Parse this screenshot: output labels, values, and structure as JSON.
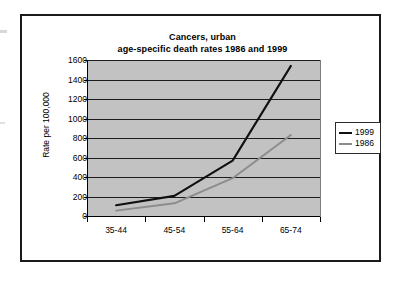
{
  "chart_data": {
    "type": "line",
    "title": "Cancers, urban",
    "subtitle": "age-specific death rates 1986 and 1999",
    "title_line1": "Cancers, urban",
    "title_line2": "age-specific death rates 1986 and 1999",
    "xlabel": "",
    "ylabel": "Rate per 100,000",
    "categories": [
      "35-44",
      "45-54",
      "55-64",
      "65-74"
    ],
    "ylim": [
      0,
      1600
    ],
    "ytick_step": 200,
    "yticks": [
      0,
      200,
      400,
      600,
      800,
      1000,
      1200,
      1400,
      1600
    ],
    "ytick_labels": [
      "0",
      "200",
      "400",
      "600",
      "800",
      "1000",
      "1200",
      "1400",
      "1600"
    ],
    "grid": true,
    "legend_position": "right",
    "plot_background": "#c2c2c2",
    "series": [
      {
        "name": "1999",
        "color": "#101010",
        "values": [
          120,
          215,
          575,
          1540
        ]
      },
      {
        "name": "1986",
        "color": "#8c8c8c",
        "values": [
          65,
          140,
          395,
          835
        ]
      }
    ]
  },
  "legend": {
    "items": [
      {
        "label": "1999",
        "color": "#101010"
      },
      {
        "label": "1986",
        "color": "#8c8c8c"
      }
    ]
  }
}
